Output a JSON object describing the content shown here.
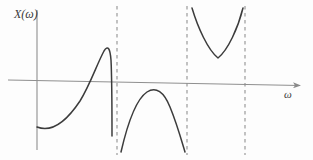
{
  "figure": {
    "kind": "mathematical-plot",
    "y_axis_label": "X(ω)",
    "x_axis_label": "ω",
    "background_color": "#fdfdfd",
    "curve_color": "#3c3c3c",
    "axis_color": "#8a8a8a",
    "asymptote_color": "#a8a8a8"
  },
  "chart_data": {
    "type": "line",
    "title": "",
    "xlabel": "ω",
    "ylabel": "X(ω)",
    "grid": false,
    "legend": null,
    "annotations": [],
    "axes": {
      "x_axis": {
        "x_start": 8,
        "y_start": 80,
        "x_end": 305,
        "y_end": 86,
        "arrow_at_end": true,
        "tick_labels": []
      },
      "y_axis": {
        "x": 37,
        "y_top": 10,
        "y_bottom": 150,
        "arrow_at_end": false,
        "tick_labels": []
      }
    },
    "asymptotes": [
      {
        "name": "asymptote-1",
        "x": 117,
        "style": "dashed"
      },
      {
        "name": "asymptote-2",
        "x": 187,
        "style": "dashed"
      },
      {
        "name": "asymptote-3",
        "x": 245,
        "style": "dashed"
      }
    ],
    "branches": [
      {
        "name": "branch-left",
        "description": "rises from lower-left, crosses axis, peaks above axis, plunges to first asymptote",
        "path": "M 37,127 C 52,133 66,122 80,101 C 90,85 97,64 104,51 C 108,45 110,48 111,60 C 112,80 112,110 112,136"
      },
      {
        "name": "branch-middle",
        "description": "inverted arch entirely below the axis between first and second asymptotes",
        "path": "M 121,152 C 127,126 135,100 147,92 C 156,86 164,92 170,107 C 177,124 182,142 185,152"
      },
      {
        "name": "branch-right",
        "description": "U shaped branch entirely above the axis between second and third asymptotes",
        "path": "M 192,8 C 198,28 208,50 218,58 C 228,50 238,28 243,8"
      }
    ]
  }
}
